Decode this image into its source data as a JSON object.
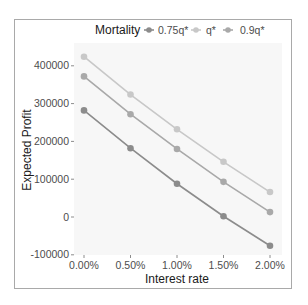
{
  "chart_data": {
    "type": "line",
    "title": "",
    "xlabel": "Interest rate",
    "ylabel": "Expected Profit",
    "categories": [
      "0.00%",
      "0.50%",
      "1.00%",
      "1.50%",
      "2.00%"
    ],
    "x": [
      0.0,
      0.5,
      1.0,
      1.5,
      2.0
    ],
    "series": [
      {
        "name": "0.75q*",
        "color": "#8c8c8c",
        "values": [
          282000,
          182000,
          88000,
          2000,
          -76000
        ]
      },
      {
        "name": "q*",
        "color": "#c8c8c8",
        "values": [
          424000,
          324000,
          232000,
          146000,
          66000
        ]
      },
      {
        "name": "0.9q*",
        "color": "#a9a9a9",
        "values": [
          372000,
          272000,
          180000,
          93000,
          13000
        ]
      }
    ],
    "yticks": [
      -100000,
      0,
      100000,
      200000,
      300000,
      400000
    ],
    "ytick_labels": [
      "-100000",
      "0",
      "100000",
      "200000",
      "300000",
      "400000"
    ],
    "ylim": [
      -115000,
      445000
    ],
    "grid": false,
    "legend": {
      "title": "Mortality",
      "position": "top",
      "entries": [
        "0.75q*",
        "q*",
        "0.9q*"
      ]
    },
    "panel_background": "#f7f7f7"
  }
}
